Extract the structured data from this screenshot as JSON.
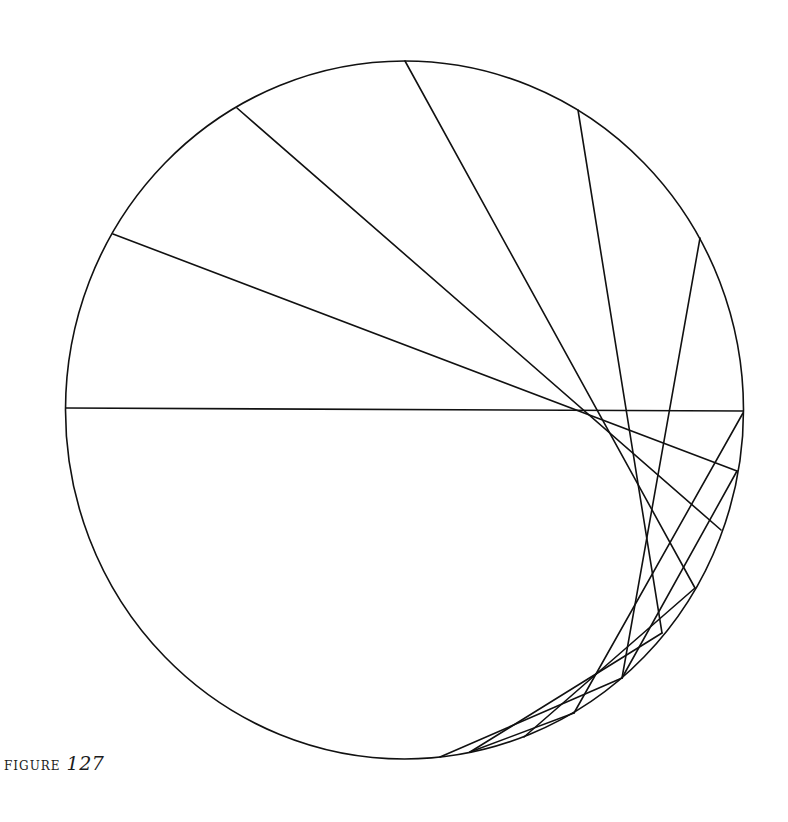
{
  "caption": {
    "label": "FIGURE",
    "number": "127"
  },
  "figure": {
    "stroke_color": "#111111",
    "circle": {
      "cx": 404.5,
      "cy": 410,
      "rx": 339,
      "ry": 349
    },
    "chords": [
      {
        "x1": 66,
        "y1": 408,
        "x2": 743,
        "y2": 411
      },
      {
        "x1": 113,
        "y1": 234,
        "x2": 737,
        "y2": 471
      },
      {
        "x1": 237,
        "y1": 108,
        "x2": 721,
        "y2": 530
      },
      {
        "x1": 405,
        "y1": 61,
        "x2": 695,
        "y2": 588
      },
      {
        "x1": 578,
        "y1": 110,
        "x2": 662,
        "y2": 633
      },
      {
        "x1": 700,
        "y1": 238,
        "x2": 622,
        "y2": 678
      },
      {
        "x1": 743,
        "y1": 413,
        "x2": 574,
        "y2": 713
      },
      {
        "x1": 737,
        "y1": 471,
        "x2": 622,
        "y2": 678
      },
      {
        "x1": 695,
        "y1": 588,
        "x2": 524,
        "y2": 737
      },
      {
        "x1": 662,
        "y1": 633,
        "x2": 470,
        "y2": 752
      },
      {
        "x1": 622,
        "y1": 678,
        "x2": 440,
        "y2": 757
      },
      {
        "x1": 574,
        "y1": 713,
        "x2": 470,
        "y2": 752
      }
    ]
  }
}
